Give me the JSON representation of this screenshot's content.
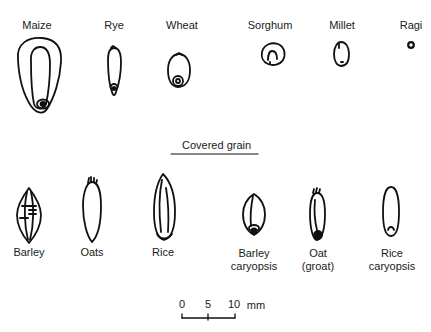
{
  "figure": {
    "naked_grains": [
      {
        "id": "maize",
        "label": "Maize",
        "x": 37,
        "y": 19
      },
      {
        "id": "rye",
        "label": "Rye",
        "x": 114,
        "y": 19
      },
      {
        "id": "wheat",
        "label": "Wheat",
        "x": 182,
        "y": 19
      },
      {
        "id": "sorghum",
        "label": "Sorghum",
        "x": 270,
        "y": 19
      },
      {
        "id": "millet",
        "label": "Millet",
        "x": 342,
        "y": 19
      },
      {
        "id": "ragi",
        "label": "Ragi",
        "x": 411,
        "y": 19
      }
    ],
    "covered_section": {
      "heading": "Covered grain"
    },
    "covered_grains": [
      {
        "id": "barley",
        "line1": "Barley",
        "line2": ""
      },
      {
        "id": "oats",
        "line1": "Oats",
        "line2": ""
      },
      {
        "id": "rice",
        "line1": "Rice",
        "line2": ""
      },
      {
        "id": "barley-caryopsis",
        "line1": "Barley",
        "line2": "caryopsis"
      },
      {
        "id": "oat-groat",
        "line1": "Oat",
        "line2": "(groat)"
      },
      {
        "id": "rice-caryopsis",
        "line1": "Rice",
        "line2": "caryopsis"
      }
    ],
    "scale_bar": {
      "ticks": [
        "0",
        "5",
        "10"
      ],
      "unit": "mm"
    },
    "colors": {
      "ink": "#111111",
      "background": "#ffffff"
    }
  }
}
